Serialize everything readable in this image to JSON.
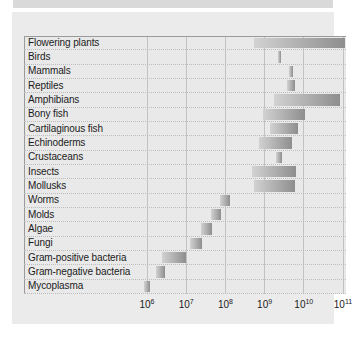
{
  "figure": {
    "title": "",
    "background_color": "#ebebeb",
    "plot_background_color": "#e9e9e9",
    "bar_color_light": "#d2d2d2",
    "bar_color_dark": "#8e8e8e",
    "gridline_color": "#c2c2c2"
  },
  "chart_data": {
    "type": "bar",
    "orientation": "horizontal",
    "title": "",
    "xlabel": "",
    "ylabel": "",
    "xscale": "log",
    "xlim": [
      1000000,
      100000000000
    ],
    "grid": true,
    "legend": "none",
    "note": "Horizontal floating (range) bars: each taxon spans a minimum and maximum genome size value on a log10 axis.",
    "xticks": [
      1000000,
      10000000,
      100000000,
      1000000000,
      10000000000,
      100000000000
    ],
    "xticklabels": [
      "10⁶",
      "10⁷",
      "10⁸",
      "10⁹",
      "10¹⁰",
      "10¹¹"
    ],
    "xtick_mantissas": [
      "10",
      "10",
      "10",
      "10",
      "10",
      "10"
    ],
    "xtick_exponents": [
      "6",
      "7",
      "8",
      "9",
      "10",
      "11"
    ],
    "categories": [
      "Flowering plants",
      "Birds",
      "Mammals",
      "Reptiles",
      "Amphibians",
      "Bony fish",
      "Cartilaginous fish",
      "Echinoderms",
      "Crustaceans",
      "Insects",
      "Mollusks",
      "Worms",
      "Molds",
      "Algae",
      "Fungi",
      "Gram-positive bacteria",
      "Gram-negative bacteria",
      "Mycoplasma"
    ],
    "ranges_log10": [
      [
        8.72,
        11.05
      ],
      [
        9.34,
        9.42
      ],
      [
        9.62,
        9.72
      ],
      [
        9.56,
        9.78
      ],
      [
        9.25,
        10.92
      ],
      [
        8.95,
        10.02
      ],
      [
        9.15,
        9.85
      ],
      [
        8.85,
        9.7
      ],
      [
        9.3,
        9.45
      ],
      [
        8.68,
        9.8
      ],
      [
        8.72,
        9.78
      ],
      [
        7.85,
        8.12
      ],
      [
        7.62,
        7.88
      ],
      [
        7.38,
        7.66
      ],
      [
        7.1,
        7.4
      ],
      [
        6.38,
        7.0
      ],
      [
        6.22,
        6.45
      ],
      [
        5.92,
        6.08
      ]
    ],
    "values_min": [
      "5.2e8",
      "2.2e9",
      "4.2e9",
      "3.6e9",
      "1.8e9",
      "8.9e8",
      "1.4e9",
      "7.1e8",
      "2.0e9",
      "4.8e8",
      "5.2e8",
      "7.1e7",
      "4.2e7",
      "2.4e7",
      "1.3e7",
      "2.4e6",
      "1.7e6",
      "8.3e5"
    ],
    "values_max": [
      "1.1e11",
      "2.6e9",
      "5.2e9",
      "6.0e9",
      "8.3e10",
      "1.0e10",
      "7.1e9",
      "5.0e9",
      "2.8e9",
      "6.3e9",
      "6.0e9",
      "1.3e8",
      "7.6e7",
      "4.6e7",
      "2.5e7",
      "1.0e7",
      "2.8e6",
      "1.2e6"
    ]
  }
}
